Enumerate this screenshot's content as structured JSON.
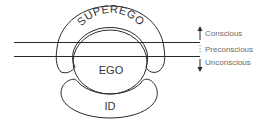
{
  "diagram": {
    "structures": {
      "superego": "SUPEREGO",
      "ego": "EGO",
      "id": "ID"
    },
    "levels": [
      {
        "label": "Conscious",
        "arrow": "up"
      },
      {
        "label": "Preconscious",
        "arrow": "none"
      },
      {
        "label": "Unconscious",
        "arrow": "down"
      }
    ],
    "colors": {
      "line": "#2a2a2a",
      "side_text": "#6a6a6a",
      "background": "#ffffff"
    }
  }
}
